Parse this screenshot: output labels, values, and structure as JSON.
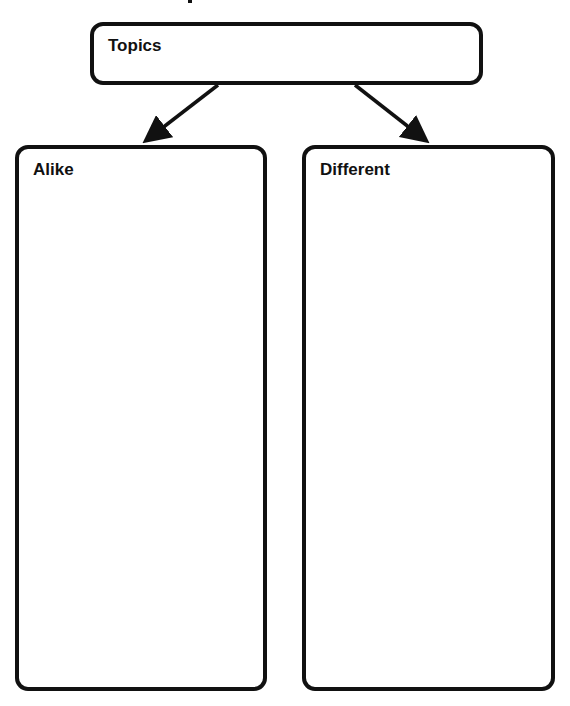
{
  "diagram": {
    "type": "compare-contrast graphic organizer",
    "top_box": {
      "label": "Topics"
    },
    "left_box": {
      "label": "Alike"
    },
    "right_box": {
      "label": "Different"
    },
    "arrows": [
      {
        "from": "top_box",
        "to": "left_box"
      },
      {
        "from": "top_box",
        "to": "right_box"
      }
    ],
    "colors": {
      "stroke": "#111111",
      "background": "#ffffff"
    }
  }
}
